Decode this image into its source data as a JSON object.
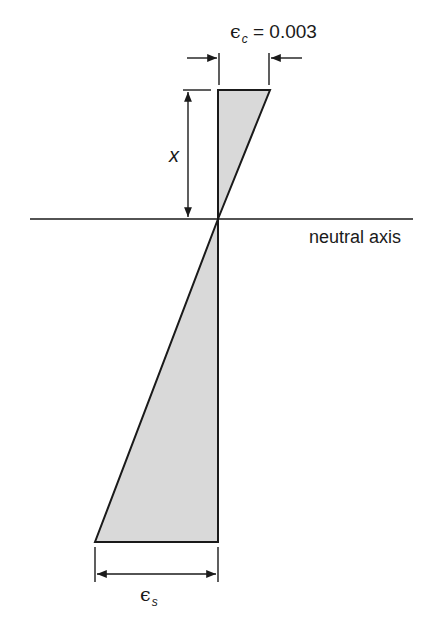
{
  "diagram": {
    "top_strain_label": {
      "symbol": "ϵ",
      "subscript": "c",
      "equals": "=",
      "value": "0.003"
    },
    "bottom_strain_label": {
      "symbol": "ϵ",
      "subscript": "s"
    },
    "depth_label": "x",
    "axis_label": "neutral axis",
    "colors": {
      "fill": "#d9d9d9",
      "stroke": "#1a1a1a",
      "background": "#ffffff"
    }
  }
}
